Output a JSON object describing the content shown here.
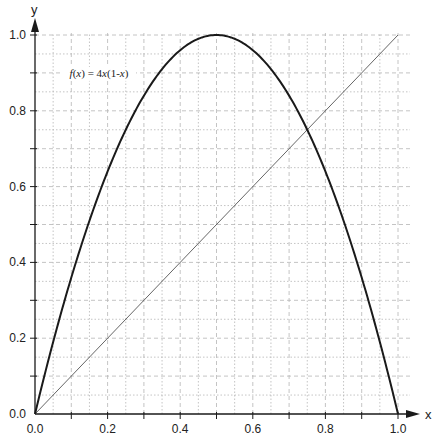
{
  "chart_data": {
    "type": "line",
    "title": "",
    "xlabel": "x",
    "ylabel": "y",
    "xlim": [
      0,
      1
    ],
    "ylim": [
      0,
      1
    ],
    "grid": true,
    "grid_step": 0.05,
    "x_ticks": [
      "0.0",
      "0.2",
      "0.4",
      "0.6",
      "0.8",
      "1.0"
    ],
    "y_ticks": [
      "0.0",
      "0.2",
      "0.4",
      "0.6",
      "0.8",
      "1.0"
    ],
    "annotations": [
      {
        "text": "f(x) = 4x(1-x)",
        "x": 0.18,
        "y": 0.9
      }
    ],
    "series": [
      {
        "name": "f(x) = 4x(1-x)",
        "style": "thick",
        "x": [
          0,
          0.05,
          0.1,
          0.15,
          0.2,
          0.25,
          0.3,
          0.35,
          0.4,
          0.45,
          0.5,
          0.55,
          0.6,
          0.65,
          0.7,
          0.75,
          0.8,
          0.85,
          0.9,
          0.95,
          1.0
        ],
        "y": [
          0,
          0.19,
          0.36,
          0.51,
          0.64,
          0.75,
          0.84,
          0.91,
          0.96,
          0.99,
          1.0,
          0.99,
          0.96,
          0.91,
          0.84,
          0.75,
          0.64,
          0.51,
          0.36,
          0.19,
          0
        ]
      },
      {
        "name": "y = x",
        "style": "thin",
        "x": [
          0,
          1
        ],
        "y": [
          0,
          1
        ]
      }
    ]
  },
  "colors": {
    "axis": "#1a1a1a",
    "grid": "#b5b5b5",
    "curve": "#1a1a1a",
    "diagonal": "#555555"
  }
}
